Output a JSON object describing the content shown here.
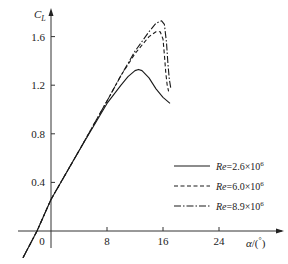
{
  "chart_data": {
    "type": "line",
    "title": "",
    "xlabel": "α/(°)",
    "ylabel": "C_L",
    "xlim": [
      -4,
      32
    ],
    "ylim": [
      -0.25,
      1.85
    ],
    "grid": false,
    "legend_position": "lower right",
    "x_ticks": [
      "0",
      "8",
      "16",
      "24"
    ],
    "y_ticks": [
      "0.4",
      "0.8",
      "1.2",
      "1.6"
    ],
    "series": [
      {
        "name": "Re=2.6×10^6",
        "style": "solid",
        "x": [
          -4,
          -2,
          0,
          4,
          8,
          10,
          11,
          12,
          12.5,
          13,
          14,
          15,
          16,
          17
        ],
        "y": [
          -0.22,
          0.0,
          0.26,
          0.66,
          1.05,
          1.2,
          1.27,
          1.32,
          1.33,
          1.32,
          1.26,
          1.17,
          1.1,
          1.05
        ]
      },
      {
        "name": "Re=6.0×10^6",
        "style": "dashed",
        "x": [
          -4,
          -2,
          0,
          4,
          8,
          10,
          12,
          14,
          15,
          15.6,
          16,
          16.2,
          16.4,
          16.6,
          16.8
        ],
        "y": [
          -0.22,
          0.0,
          0.26,
          0.66,
          1.07,
          1.28,
          1.46,
          1.6,
          1.64,
          1.64,
          1.58,
          1.45,
          1.3,
          1.2,
          1.15
        ]
      },
      {
        "name": "Re=8.9×10^6",
        "style": "dashdot",
        "x": [
          -4,
          -2,
          0,
          4,
          8,
          10,
          12,
          14,
          15,
          15.8,
          16.2,
          16.5,
          16.7,
          16.9,
          17.1
        ],
        "y": [
          -0.22,
          0.0,
          0.26,
          0.66,
          1.07,
          1.28,
          1.48,
          1.64,
          1.71,
          1.73,
          1.7,
          1.55,
          1.38,
          1.25,
          1.18
        ]
      }
    ]
  },
  "axes": {
    "x_label_prefix": "α/(",
    "x_label_suffix": "°)",
    "y_label_main": "C",
    "y_label_sub": "L",
    "x_ticks": [
      {
        "label": "0",
        "value": 0
      },
      {
        "label": "8",
        "value": 8
      },
      {
        "label": "16",
        "value": 16
      },
      {
        "label": "24",
        "value": 24
      }
    ],
    "y_ticks": [
      {
        "label": "0.4",
        "value": 0.4
      },
      {
        "label": "0.8",
        "value": 0.8
      },
      {
        "label": "1.2",
        "value": 1.2
      },
      {
        "label": "1.6",
        "value": 1.6
      }
    ]
  },
  "legend": [
    {
      "re": "Re",
      "value": "=2.6×10",
      "exp": "6",
      "style": "solid"
    },
    {
      "re": "Re",
      "value": "=6.0×10",
      "exp": "6",
      "style": "dashed"
    },
    {
      "re": "Re",
      "value": "=8.9×10",
      "exp": "6",
      "style": "dashdot"
    }
  ]
}
